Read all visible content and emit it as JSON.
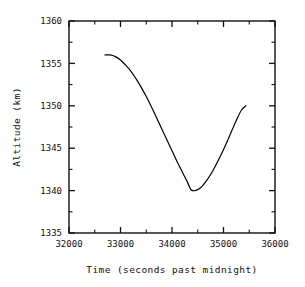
{
  "chart_data": {
    "type": "line",
    "title": "",
    "subtitle": "",
    "xlabel": "Time (seconds past midnight)",
    "ylabel": "Altitude (km)",
    "xlim": [
      32000,
      36000
    ],
    "ylim": [
      1335,
      1360
    ],
    "grid": false,
    "legend": null,
    "legend_position": "none",
    "xticks": [
      32000,
      33000,
      34000,
      35000,
      36000
    ],
    "xtick_labels": [
      "32000",
      "33000",
      "34000",
      "35000",
      "36000"
    ],
    "x_minor_ticks": [
      32500,
      33500,
      34500,
      35500
    ],
    "yticks": [
      1335,
      1340,
      1345,
      1350,
      1355,
      1360
    ],
    "ytick_labels": [
      "1335",
      "1340",
      "1345",
      "1350",
      "1355",
      "1360"
    ],
    "y_minor_ticks": [
      1337.5,
      1342.5,
      1347.5,
      1352.5,
      1357.5
    ],
    "series": [
      {
        "name": "altitude",
        "color": "#000000",
        "line_width": 1.2,
        "x": [
          32700,
          32800,
          32900,
          33000,
          33100,
          33200,
          33300,
          33400,
          33500,
          33600,
          33700,
          33800,
          33900,
          34000,
          34100,
          34200,
          34300,
          34370,
          34450,
          34550,
          34650,
          34750,
          34850,
          34950,
          35050,
          35150,
          35250,
          35350,
          35435
        ],
        "y": [
          1356.0,
          1356.0,
          1355.8,
          1355.4,
          1354.8,
          1354.1,
          1353.2,
          1352.2,
          1351.1,
          1349.9,
          1348.6,
          1347.3,
          1346.0,
          1344.7,
          1343.4,
          1342.2,
          1341.0,
          1340.1,
          1340.0,
          1340.3,
          1341.0,
          1341.9,
          1343.0,
          1344.2,
          1345.5,
          1346.9,
          1348.3,
          1349.5,
          1350.0
        ]
      }
    ],
    "annotations": []
  },
  "axes": {
    "x_title": "Time (seconds past midnight)",
    "y_title": "Altitude (km)"
  },
  "colors": {
    "line": "#000000",
    "frame": "#111111",
    "background": "#ffffff",
    "text": "#111111"
  }
}
